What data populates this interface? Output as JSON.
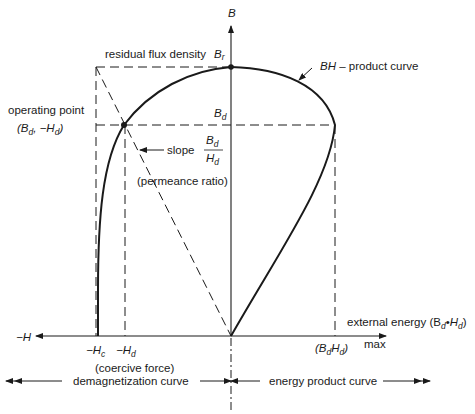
{
  "diagram": {
    "type": "magnet demagnetization and energy product curve",
    "axes": {
      "y_label": "B",
      "neg_x_label": "−H",
      "pos_x_label": "max"
    },
    "labels": {
      "residual_flux": "residual flux density",
      "br_symbol": "B",
      "br_sub": "r",
      "bh_curve": "BH – product curve",
      "bh_curve_italic": "BH",
      "bh_curve_rest": " – product curve",
      "bd_symbol": "B",
      "bd_sub": "d",
      "operating_point": "operating point",
      "operating_point_coords": "(B",
      "op_sub1": "d",
      "op_mid": ", −H",
      "op_sub2": "d",
      "op_close": ")",
      "slope": "slope",
      "slope_num": "B",
      "slope_num_sub": "d",
      "slope_den": "H",
      "slope_den_sub": "d",
      "permeance": "(permeance ratio)",
      "hc": "−H",
      "hc_sub": "c",
      "hd": "−H",
      "hd_sub": "d",
      "coercive_force": "(coercive force)",
      "external_energy": "external energy (B",
      "ext_sub1": "d",
      "ext_dot": "•",
      "ext_h": "H",
      "ext_sub2": "d",
      "ext_close": ")",
      "bdhd_open": "(B",
      "bdhd_sub1": "d",
      "bdhd_h": "H",
      "bdhd_sub2": "d",
      "bdhd_close": ")",
      "max": "max",
      "demag_curve": "demagnetization curve",
      "energy_curve": "energy product curve"
    },
    "colors": {
      "ink": "#1a1a1a",
      "background": "#ffffff"
    }
  }
}
